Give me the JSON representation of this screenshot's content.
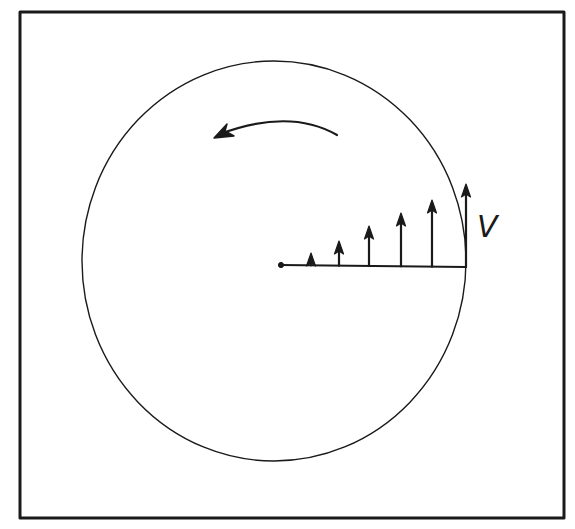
{
  "diagram": {
    "type": "rotating-disk-velocity-profile",
    "colors": {
      "ink": "#1a1a1a",
      "background": "#ffffff"
    },
    "frame": {
      "x": 20,
      "y": 12,
      "width": 544,
      "height": 506
    },
    "circle": {
      "cx": 274,
      "cy": 261,
      "rx": 192,
      "ry": 200
    },
    "radius_line": {
      "x1": 281,
      "y1": 265,
      "x2": 466,
      "y2": 267
    },
    "origin_dot": {
      "x": 281,
      "y": 265
    },
    "rotation_arrow": {
      "direction": "counterclockwise",
      "start": {
        "x": 337,
        "y": 135
      },
      "end": {
        "x": 216,
        "y": 137
      }
    },
    "velocity_vectors": [
      {
        "x": 311,
        "tip_y": 253
      },
      {
        "x": 339,
        "tip_y": 241
      },
      {
        "x": 369,
        "tip_y": 226
      },
      {
        "x": 401,
        "tip_y": 213
      },
      {
        "x": 432,
        "tip_y": 200
      },
      {
        "x": 466,
        "tip_y": 184
      }
    ],
    "velocity_label": "V"
  }
}
